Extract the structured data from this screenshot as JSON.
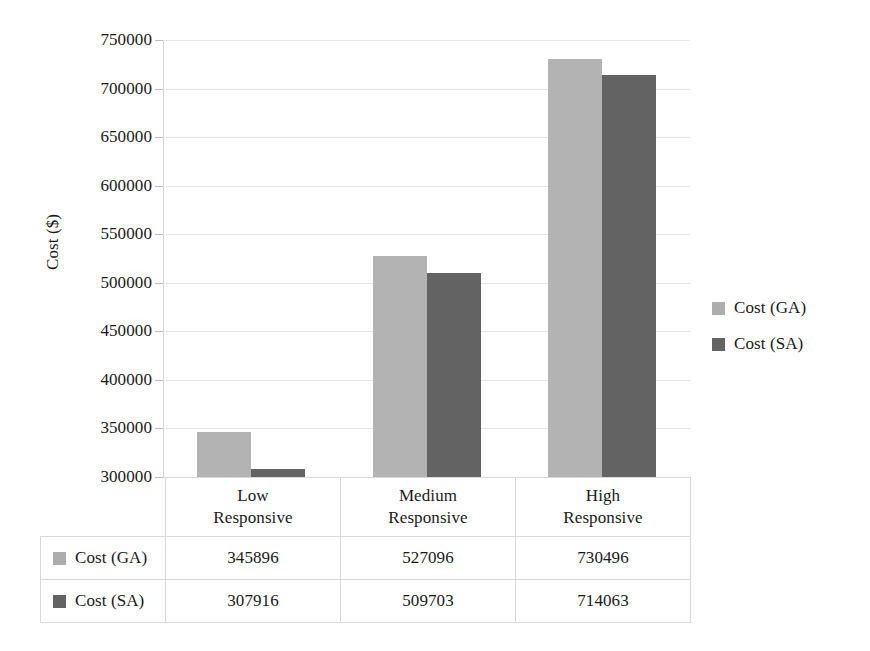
{
  "chart_data": {
    "type": "bar",
    "title": "",
    "xlabel": "",
    "ylabel": "Cost ($)",
    "ylim": [
      300000,
      750000
    ],
    "ytick_step": 50000,
    "yticks": [
      750000,
      700000,
      650000,
      600000,
      550000,
      500000,
      450000,
      400000,
      350000,
      300000
    ],
    "ytick_labels": [
      "750000",
      "700000",
      "650000",
      "600000",
      "550000",
      "500000",
      "450000",
      "400000",
      "350000",
      "300000"
    ],
    "categories": [
      "Low Responsive",
      "Medium Responsive",
      "High Responsive"
    ],
    "category_lines": [
      [
        "Low",
        "Responsive"
      ],
      [
        "Medium",
        "Responsive"
      ],
      [
        "High",
        "Responsive"
      ]
    ],
    "grid": true,
    "legend_position": "right",
    "data_table_visible": true,
    "series": [
      {
        "name": "Cost (GA)",
        "color": "#b3b3b3",
        "values": [
          345896,
          527096,
          730496
        ],
        "value_labels": [
          "345896",
          "527096",
          "730496"
        ]
      },
      {
        "name": "Cost (SA)",
        "color": "#636363",
        "values": [
          307916,
          509703,
          714063
        ],
        "value_labels": [
          "307916",
          "509703",
          "714063"
        ]
      }
    ]
  },
  "legend": {
    "items": [
      {
        "label": "Cost (GA)",
        "color": "#b3b3b3"
      },
      {
        "label": "Cost (SA)",
        "color": "#636363"
      }
    ]
  },
  "table": {
    "row_keys": [
      "Cost (GA)",
      "Cost (SA)"
    ],
    "rows": [
      [
        "345896",
        "527096",
        "730496"
      ],
      [
        "307916",
        "509703",
        "714063"
      ]
    ]
  },
  "colors": {
    "series_ga": "#b3b3b3",
    "series_sa": "#636363",
    "gridline": "#e6e6e6",
    "axis": "#c9c9c9",
    "table_border": "#d9d9d9",
    "text": "#1a1a1a",
    "background": "#ffffff"
  }
}
